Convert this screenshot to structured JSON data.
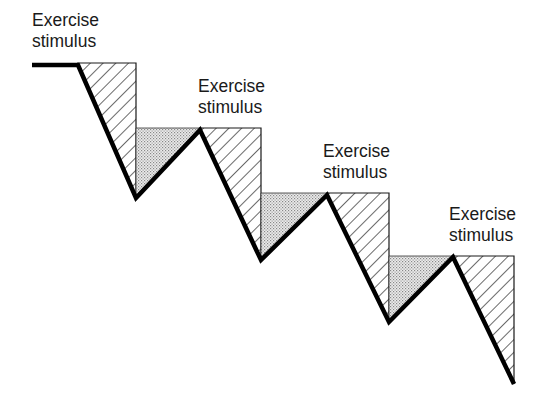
{
  "diagram": {
    "labels": [
      {
        "line1": "Exercise",
        "line2": "stimulus"
      },
      {
        "line1": "Exercise",
        "line2": "stimulus"
      },
      {
        "line1": "Exercise",
        "line2": "stimulus"
      },
      {
        "line1": "Exercise",
        "line2": "stimulus"
      }
    ],
    "colors": {
      "line": "#000000",
      "hatch": "#1a1a1a",
      "stipple": "#bdbdbd",
      "background": "#ffffff"
    }
  }
}
